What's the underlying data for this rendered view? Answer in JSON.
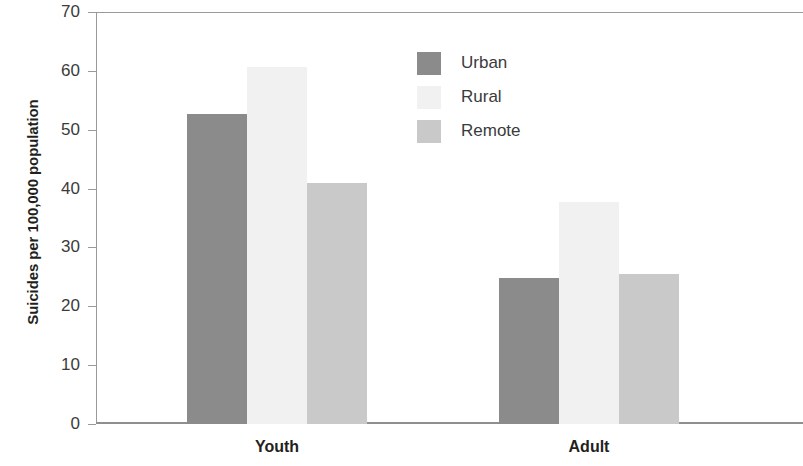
{
  "chart_data": {
    "type": "bar",
    "title": "",
    "xlabel": "",
    "ylabel": "Suicides per 100,000 population",
    "categories": [
      "Youth",
      "Adult"
    ],
    "series": [
      {
        "name": "Urban",
        "color": "#8b8b8b",
        "values": [
          52.7,
          24.8
        ]
      },
      {
        "name": "Rural",
        "color": "#f1f1f1",
        "values": [
          60.6,
          37.7
        ]
      },
      {
        "name": "Remote",
        "color": "#c9c9c9",
        "values": [
          40.9,
          25.5
        ]
      }
    ],
    "ylim": [
      0,
      70
    ],
    "yticks": [
      0,
      10,
      20,
      30,
      40,
      50,
      60,
      70
    ],
    "ytick_labels": [
      "0",
      "10",
      "20",
      "30",
      "40",
      "50",
      "60",
      "70"
    ],
    "grid": false,
    "legend_position": "upper-center",
    "axis_color": "#9a9a9a",
    "text_color": "#231f20"
  }
}
